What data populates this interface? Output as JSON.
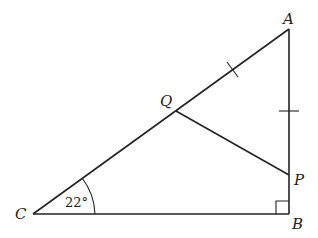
{
  "diagram": {
    "type": "geometry-triangle",
    "points": {
      "A": {
        "label": "A",
        "x": 289,
        "y": 29
      },
      "B": {
        "label": "B",
        "x": 289,
        "y": 214
      },
      "C": {
        "label": "C",
        "x": 33,
        "y": 214
      },
      "Q": {
        "label": "Q",
        "x": 176,
        "y": 111
      },
      "P": {
        "label": "P",
        "x": 289,
        "y": 175
      }
    },
    "angle_label": "22°",
    "right_angle_at": "B",
    "equal_marks": [
      "AQ",
      "AP"
    ],
    "line_color": "#222222"
  }
}
